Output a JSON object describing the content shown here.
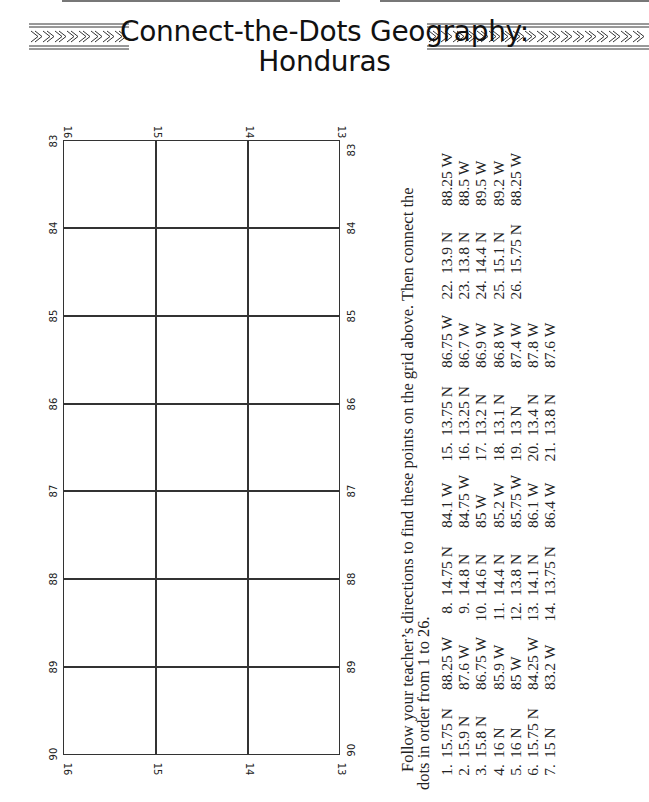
{
  "page": {
    "title_line1": "Connect-the-Dots Geography:",
    "title_line2": "Honduras",
    "banner_ornament": "chevron-border"
  },
  "grid": {
    "longitude_labels": [
      "83",
      "84",
      "85",
      "86",
      "87",
      "88",
      "89",
      "90"
    ],
    "latitude_labels": [
      "16",
      "15",
      "14",
      "13"
    ],
    "columns": 3,
    "rows": 7
  },
  "instructions": {
    "line1": "Follow your teacher’s directions to find these points on the grid above. Then connect the",
    "line2": "dots in order from 1 to 26."
  },
  "points": [
    {
      "num": "1.",
      "lat": "15.75 N",
      "lon": "88.25 W"
    },
    {
      "num": "2.",
      "lat": "15.9 N",
      "lon": "87.6 W"
    },
    {
      "num": "3.",
      "lat": "15.8 N",
      "lon": "86.75 W"
    },
    {
      "num": "4.",
      "lat": "16 N",
      "lon": "85.9 W"
    },
    {
      "num": "5.",
      "lat": "16 N",
      "lon": "85 W"
    },
    {
      "num": "6.",
      "lat": "15.75 N",
      "lon": "84.25 W"
    },
    {
      "num": "7.",
      "lat": "15 N",
      "lon": "83.2 W"
    },
    {
      "num": "8.",
      "lat": "14.75 N",
      "lon": "84.1 W"
    },
    {
      "num": "9.",
      "lat": "14.8 N",
      "lon": "84.75 W"
    },
    {
      "num": "10.",
      "lat": "14.6 N",
      "lon": "85 W"
    },
    {
      "num": "11.",
      "lat": "14.4 N",
      "lon": "85.2 W"
    },
    {
      "num": "12.",
      "lat": "13.8 N",
      "lon": "85.75 W"
    },
    {
      "num": "13.",
      "lat": "14.1 N",
      "lon": "86.1 W"
    },
    {
      "num": "14.",
      "lat": "13.75 N",
      "lon": "86.4 W"
    },
    {
      "num": "15.",
      "lat": "13.75 N",
      "lon": "86.75 W"
    },
    {
      "num": "16.",
      "lat": "13.25 N",
      "lon": "86.7 W"
    },
    {
      "num": "17.",
      "lat": "13.2 N",
      "lon": "86.9 W"
    },
    {
      "num": "18.",
      "lat": "13.1 N",
      "lon": "86.8 W"
    },
    {
      "num": "19.",
      "lat": "13 N",
      "lon": "87.4 W"
    },
    {
      "num": "20.",
      "lat": "13.4 N",
      "lon": "87.8 W"
    },
    {
      "num": "21.",
      "lat": "13.8 N",
      "lon": "87.6 W"
    },
    {
      "num": "22.",
      "lat": "13.9 N",
      "lon": "88.25 W"
    },
    {
      "num": "23.",
      "lat": "13.8 N",
      "lon": "88.5 W"
    },
    {
      "num": "24.",
      "lat": "14.4 N",
      "lon": "89.5 W"
    },
    {
      "num": "25.",
      "lat": "15.1 N",
      "lon": "89.2 W"
    },
    {
      "num": "26.",
      "lat": "15.75 N",
      "lon": "88.25 W"
    }
  ]
}
